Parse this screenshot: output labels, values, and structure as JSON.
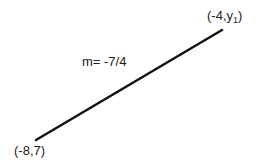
{
  "diagram": {
    "type": "line-segment",
    "points": [
      {
        "label": "(-8,7)",
        "x": -8,
        "y": 7
      },
      {
        "label_prefix": "(-4,y",
        "label_sub": "1",
        "label_suffix": ")",
        "x": -4,
        "y": "y1"
      }
    ],
    "slope_label": "m= -7/4",
    "line_color": "#111111"
  }
}
